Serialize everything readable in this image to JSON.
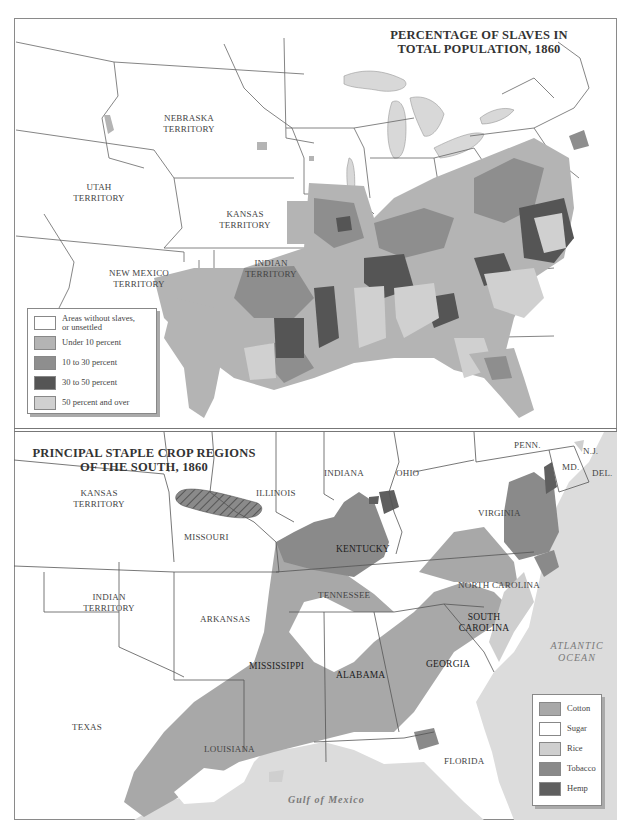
{
  "top_map": {
    "title_line1": "PERCENTAGE OF SLAVES IN",
    "title_line2": "TOTAL POPULATION, 1860",
    "labels": {
      "nebraska": [
        "NEBRASKA",
        "TERRITORY"
      ],
      "utah": [
        "UTAH",
        "TERRITORY"
      ],
      "kansas": [
        "KANSAS",
        "TERRITORY"
      ],
      "indian": [
        "INDIAN",
        "TERRITORY"
      ],
      "new_mexico": [
        "NEW MEXICO",
        "TERRITORY"
      ]
    },
    "legend": [
      {
        "label": "Areas without slaves, or unsettled",
        "line1": "Areas without slaves,",
        "line2": "or unsettled",
        "color": "#ffffff"
      },
      {
        "label": "Under 10 percent",
        "line1": "Under 10 percent",
        "line2": "",
        "color": "#b4b4b4"
      },
      {
        "label": "10 to 30 percent",
        "line1": "10 to 30 percent",
        "line2": "",
        "color": "#8e8e8e"
      },
      {
        "label": "30 to 50 percent",
        "line1": "30 to 50 percent",
        "line2": "",
        "color": "#555555"
      },
      {
        "label": "50 percent and over",
        "line1": "50 percent and over",
        "line2": "",
        "color": "#d0d0d0"
      }
    ],
    "colors": {
      "water": "#d8d8d8",
      "under10": "#b4b4b4",
      "p10to30": "#8e8e8e",
      "p30to50": "#555555",
      "p50plus": "#d0d0d0",
      "border": "#666666"
    }
  },
  "bottom_map": {
    "title_line1": "PRINCIPAL STAPLE CROP REGIONS",
    "title_line2": "OF THE SOUTH, 1860",
    "labels": {
      "kansas": [
        "KANSAS",
        "TERRITORY"
      ],
      "missouri": "MISSOURI",
      "illinois": "ILLINOIS",
      "indiana": "INDIANA",
      "ohio": "OHIO",
      "penn": "PENN.",
      "nj": "N.J.",
      "md": "MD.",
      "del": "DEL.",
      "virginia": "VIRGINIA",
      "kentucky": "KENTUCKY",
      "indian": [
        "INDIAN",
        "TERRITORY"
      ],
      "arkansas": "ARKANSAS",
      "tennessee": "TENNESSEE",
      "north_carolina": "NORTH CAROLINA",
      "south_carolina": [
        "SOUTH",
        "CAROLINA"
      ],
      "mississippi": "MISSISSIPPI",
      "alabama": "ALABAMA",
      "georgia": "GEORGIA",
      "texas": "TEXAS",
      "louisiana": "LOUISIANA",
      "florida": "FLORIDA",
      "atlantic": [
        "ATLANTIC",
        "OCEAN"
      ],
      "gulf": "Gulf of Mexico"
    },
    "legend": [
      {
        "label": "Cotton",
        "color": "#a8a8a8"
      },
      {
        "label": "Sugar",
        "color": "#ffffff"
      },
      {
        "label": "Rice",
        "color": "#cfcfcf"
      },
      {
        "label": "Tobacco",
        "color": "#8a8a8a"
      },
      {
        "label": "Hemp",
        "color": "#5f5f5f"
      }
    ],
    "colors": {
      "water": "#dcdcdc",
      "cotton": "#a8a8a8",
      "rice": "#cfcfcf",
      "tobacco": "#8a8a8a",
      "hemp": "#5f5f5f",
      "border": "#555555"
    }
  }
}
